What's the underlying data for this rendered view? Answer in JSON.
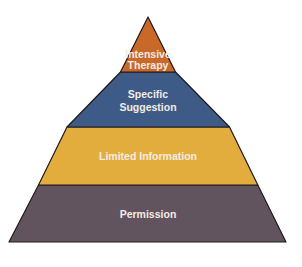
{
  "diagram": {
    "type": "pyramid",
    "layers": [
      {
        "id": "intensive-therapy",
        "lines": [
          "Intensive",
          "Therapy"
        ],
        "color": "#C8692A",
        "order_from_top": 1
      },
      {
        "id": "specific-suggestion",
        "lines": [
          "Specific",
          "Suggestion"
        ],
        "color": "#3E5A86",
        "order_from_top": 2
      },
      {
        "id": "limited-information",
        "lines": [
          "Limited Information"
        ],
        "color": "#E3AD3E",
        "order_from_top": 3
      },
      {
        "id": "permission",
        "lines": [
          "Permission"
        ],
        "color": "#62545F",
        "order_from_top": 4
      }
    ],
    "outline_color": "#1e1a1c",
    "text_color": "#f3ece4"
  }
}
